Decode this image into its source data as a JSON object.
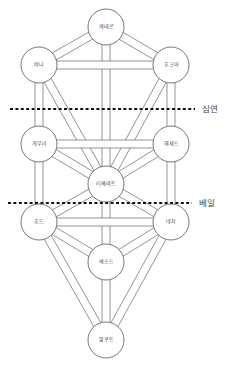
{
  "diagram": {
    "title": "",
    "colors": {
      "background": "#ffffff",
      "stroke": "#555555",
      "divider": "#111111",
      "text": "#444444"
    },
    "node_radius": 18,
    "path_width": 8,
    "nodes": [
      {
        "id": "keter",
        "label": "케테르",
        "x": 106,
        "y": 27
      },
      {
        "id": "binah",
        "label": "비나",
        "x": 39,
        "y": 65
      },
      {
        "id": "chokmah",
        "label": "호크마",
        "x": 171,
        "y": 65
      },
      {
        "id": "geburah",
        "label": "게부라",
        "x": 39,
        "y": 144
      },
      {
        "id": "chesed",
        "label": "헤세드",
        "x": 171,
        "y": 144
      },
      {
        "id": "tiphareth",
        "label": "티페레트",
        "x": 106,
        "y": 184
      },
      {
        "id": "hod",
        "label": "호드",
        "x": 39,
        "y": 222
      },
      {
        "id": "netzach",
        "label": "네차",
        "x": 171,
        "y": 222
      },
      {
        "id": "yesod",
        "label": "예소드",
        "x": 106,
        "y": 262
      },
      {
        "id": "malkuth",
        "label": "말쿠트",
        "x": 106,
        "y": 340
      }
    ],
    "paths": [
      [
        "keter",
        "binah"
      ],
      [
        "keter",
        "chokmah"
      ],
      [
        "keter",
        "tiphareth"
      ],
      [
        "binah",
        "chokmah"
      ],
      [
        "binah",
        "geburah"
      ],
      [
        "binah",
        "tiphareth"
      ],
      [
        "chokmah",
        "chesed"
      ],
      [
        "chokmah",
        "tiphareth"
      ],
      [
        "geburah",
        "chesed"
      ],
      [
        "geburah",
        "tiphareth"
      ],
      [
        "geburah",
        "hod"
      ],
      [
        "chesed",
        "tiphareth"
      ],
      [
        "chesed",
        "netzach"
      ],
      [
        "tiphareth",
        "hod"
      ],
      [
        "tiphareth",
        "netzach"
      ],
      [
        "tiphareth",
        "yesod"
      ],
      [
        "hod",
        "netzach"
      ],
      [
        "hod",
        "yesod"
      ],
      [
        "hod",
        "malkuth"
      ],
      [
        "netzach",
        "yesod"
      ],
      [
        "netzach",
        "malkuth"
      ],
      [
        "yesod",
        "malkuth"
      ]
    ],
    "dividers": [
      {
        "id": "abyss",
        "label": "심연",
        "y": 109,
        "x1": 10,
        "x2": 195,
        "label_x": 202
      },
      {
        "id": "veil",
        "label": "베일",
        "y": 203,
        "x1": 8,
        "x2": 192,
        "label_x": 199
      }
    ]
  }
}
